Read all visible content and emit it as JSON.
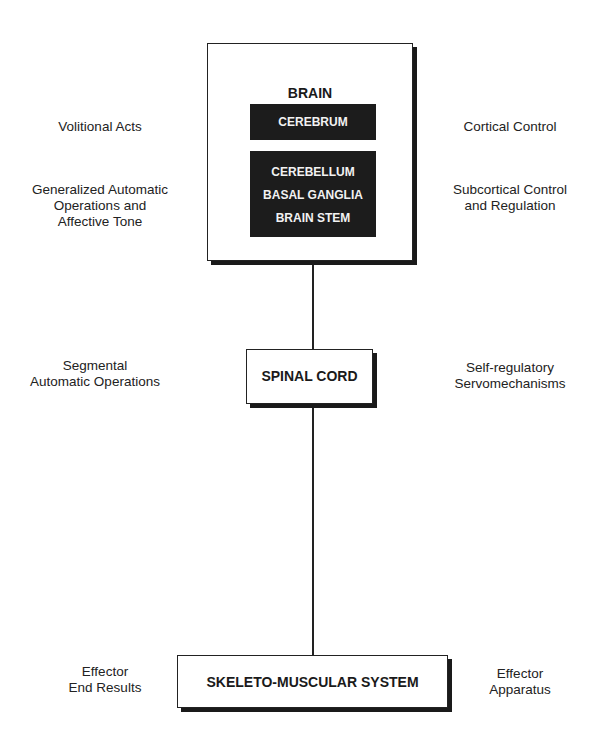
{
  "diagram": {
    "brain": {
      "title": "BRAIN",
      "cerebrum": "CEREBRUM",
      "lower": [
        "CEREBELLUM",
        "BASAL GANGLIA",
        "BRAIN STEM"
      ]
    },
    "spinal_cord": "SPINAL CORD",
    "skeleto_muscular": "SKELETO-MUSCULAR SYSTEM",
    "left_labels": {
      "volitional": [
        "Volitional Acts"
      ],
      "generalized": [
        "Generalized Automatic",
        "Operations and",
        "Affective Tone"
      ],
      "segmental": [
        "Segmental",
        "Automatic Operations"
      ],
      "effector_end": [
        "Effector",
        "End Results"
      ]
    },
    "right_labels": {
      "cortical": [
        "Cortical Control"
      ],
      "subcortical": [
        "Subcortical Control",
        "and Regulation"
      ],
      "self_regulatory": [
        "Self-regulatory",
        "Servomechanisms"
      ],
      "effector_apparatus": [
        "Effector",
        "Apparatus"
      ]
    }
  }
}
